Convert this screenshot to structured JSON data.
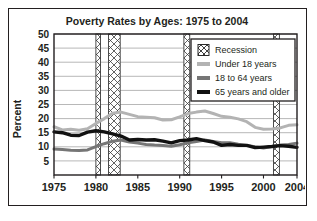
{
  "figure": {
    "title": "Poverty Rates by Ages: 1975 to 2004",
    "ylabel": "Percent"
  },
  "legend": {
    "items": [
      {
        "label": "Recession",
        "swatch": "hatch",
        "color": "#ffffff"
      },
      {
        "label": "Under 18 years",
        "swatch": "line",
        "color": "#b3b3b3"
      },
      {
        "label": "18 to 64 years",
        "swatch": "line",
        "color": "#767676"
      },
      {
        "label": "65 years and older",
        "swatch": "line",
        "color": "#111111"
      }
    ]
  },
  "chart_data": {
    "type": "line",
    "title": "Poverty Rates by Ages: 1975 to 2004",
    "xlabel": "",
    "ylabel": "Percent",
    "xlim": [
      1975,
      2004
    ],
    "ylim": [
      0,
      50
    ],
    "yticks": [
      5,
      10,
      15,
      20,
      25,
      30,
      35,
      40,
      45,
      50
    ],
    "xticks": [
      1975,
      1980,
      1985,
      1990,
      1995,
      2000,
      2004
    ],
    "grid": "horizontal",
    "legend_position": "top-right",
    "x": [
      1975,
      1976,
      1977,
      1978,
      1979,
      1980,
      1981,
      1982,
      1983,
      1984,
      1985,
      1986,
      1987,
      1988,
      1989,
      1990,
      1991,
      1992,
      1993,
      1994,
      1995,
      1996,
      1997,
      1998,
      1999,
      2000,
      2001,
      2002,
      2003,
      2004
    ],
    "series": [
      {
        "name": "Under 18 years",
        "color": "#b3b3b3",
        "values": [
          17.1,
          16.0,
          16.2,
          15.9,
          16.4,
          18.3,
          20.0,
          21.9,
          22.3,
          21.5,
          20.7,
          20.5,
          20.3,
          19.5,
          19.6,
          20.6,
          21.8,
          22.3,
          22.7,
          21.8,
          20.8,
          20.5,
          19.9,
          18.9,
          16.9,
          16.2,
          16.3,
          16.7,
          17.6,
          17.8
        ]
      },
      {
        "name": "18 to 64 years",
        "color": "#767676",
        "values": [
          9.2,
          9.0,
          8.8,
          8.7,
          8.9,
          10.1,
          11.1,
          12.0,
          12.4,
          11.7,
          11.3,
          10.8,
          10.6,
          10.5,
          10.2,
          10.7,
          11.4,
          11.9,
          12.4,
          11.9,
          11.4,
          11.4,
          10.9,
          10.5,
          10.0,
          9.6,
          10.1,
          10.6,
          10.8,
          11.3
        ]
      },
      {
        "name": "65 years and older",
        "color": "#111111",
        "values": [
          15.3,
          15.0,
          14.1,
          14.0,
          15.2,
          15.7,
          15.3,
          14.6,
          13.8,
          12.4,
          12.6,
          12.4,
          12.5,
          12.0,
          11.4,
          12.2,
          12.4,
          12.9,
          12.2,
          11.7,
          10.5,
          10.8,
          10.5,
          10.5,
          9.7,
          9.9,
          10.1,
          10.4,
          10.2,
          9.8
        ]
      }
    ],
    "recession_bands": [
      {
        "start": 1980.0,
        "end": 1980.55
      },
      {
        "start": 1981.5,
        "end": 1982.9
      },
      {
        "start": 1990.5,
        "end": 1991.2
      },
      {
        "start": 2001.2,
        "end": 2001.9
      }
    ]
  }
}
